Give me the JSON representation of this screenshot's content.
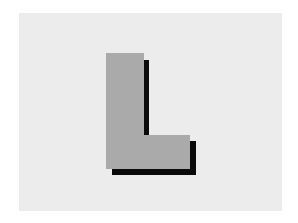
{
  "figure": {
    "glyph": "L",
    "colors": {
      "page_background": "#ffffff",
      "panel_background": "#ececec",
      "letter_fill": "#aaaaaa",
      "shadow_fill": "#0a0a0a"
    }
  }
}
